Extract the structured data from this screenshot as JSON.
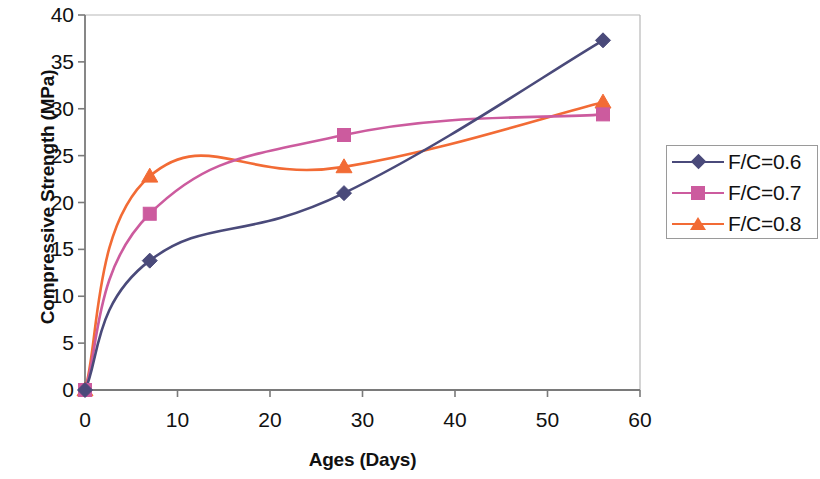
{
  "chart_data": {
    "type": "line",
    "title": "",
    "xlabel": "Ages (Days)",
    "ylabel": "Compressive Strength (MPa)",
    "xlim": [
      0,
      60
    ],
    "ylim": [
      0,
      40
    ],
    "xticks": [
      0,
      10,
      20,
      30,
      40,
      50,
      60
    ],
    "yticks": [
      0,
      5,
      10,
      15,
      20,
      25,
      30,
      35,
      40
    ],
    "grid": false,
    "legend_position": "right-outside",
    "x": [
      0,
      7,
      28,
      56
    ],
    "series": [
      {
        "name": "F/C=0.6",
        "color": "#4a4a7a",
        "marker": "diamond",
        "values": [
          0,
          13.8,
          21.0,
          37.3
        ]
      },
      {
        "name": "F/C=0.7",
        "color": "#cc5b9e",
        "marker": "square",
        "values": [
          0,
          18.8,
          27.2,
          29.4
        ]
      },
      {
        "name": "F/C=0.8",
        "color": "#f26b35",
        "marker": "triangle",
        "values": [
          0,
          22.8,
          23.8,
          30.7
        ]
      }
    ]
  },
  "axis": {
    "x_tick_labels": [
      "0",
      "10",
      "20",
      "30",
      "40",
      "50",
      "60"
    ],
    "y_tick_labels": [
      "0",
      "5",
      "10",
      "15",
      "20",
      "25",
      "30",
      "35",
      "40"
    ],
    "x_title": "Ages (Days)",
    "y_title": "Compressive Strength (MPa)"
  },
  "legend": {
    "items": [
      {
        "label": "F/C=0.6"
      },
      {
        "label": "F/C=0.7"
      },
      {
        "label": "F/C=0.8"
      }
    ]
  },
  "colors": {
    "series1": "#4a4a7a",
    "series2": "#cc5b9e",
    "series3": "#f26b35",
    "axis": "#7a7a7a",
    "text": "#111111",
    "legend_border": "#9a9a9a",
    "background": "#ffffff"
  }
}
